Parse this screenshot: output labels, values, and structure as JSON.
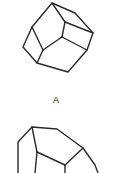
{
  "figure": {
    "label_a": "A",
    "stroke_color": "#2a2a2a",
    "background": "#ffffff"
  }
}
